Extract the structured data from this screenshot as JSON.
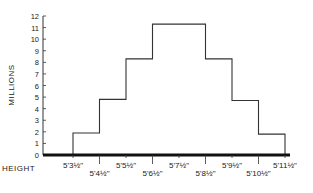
{
  "chart_data": {
    "type": "bar",
    "style": "step-histogram",
    "title": "",
    "xlabel": "HEIGHT",
    "ylabel": "MILLIONS",
    "ylim": [
      0,
      12
    ],
    "yticks": [
      0,
      1,
      2,
      3,
      4,
      5,
      6,
      7,
      8,
      9,
      10,
      11,
      12
    ],
    "xtick_labels": [
      "5'3½\"",
      "5'4½\"",
      "5'5½\"",
      "5'6½\"",
      "5'7½\"",
      "5'8½\"",
      "5'9½\"",
      "5'10½\"",
      "5'11½\""
    ],
    "grid": false,
    "legend": null,
    "bins": [
      {
        "from": "5'3½\"",
        "to": "5'4½\"",
        "value": 1.9
      },
      {
        "from": "5'4½\"",
        "to": "5'5½\"",
        "value": 4.8
      },
      {
        "from": "5'5½\"",
        "to": "5'6½\"",
        "value": 8.3
      },
      {
        "from": "5'6½\"",
        "to": "5'8½\"",
        "value": 11.3
      },
      {
        "from": "5'8½\"",
        "to": "5'9½\"",
        "value": 8.3
      },
      {
        "from": "5'9½\"",
        "to": "5'10½\"",
        "value": 4.7
      },
      {
        "from": "5'10½\"",
        "to": "5'11½\"",
        "value": 1.8
      }
    ]
  },
  "labels": {
    "ylabel": "MILLIONS",
    "xlabel": "HEIGHT"
  }
}
